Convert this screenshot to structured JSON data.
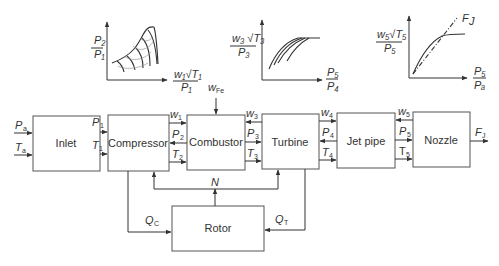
{
  "blocks": {
    "inlet": "Inlet",
    "compressor": "Compressor",
    "combustor": "Combustor",
    "turbine": "Turbine",
    "jetpipe": "Jet pipe",
    "nozzle": "Nozzle",
    "rotor": "Rotor"
  },
  "signals": {
    "Pa": {
      "main": "P",
      "sub": "a"
    },
    "Ta": {
      "main": "T",
      "sub": "a"
    },
    "P1": {
      "main": "P",
      "sub": "1"
    },
    "T1": {
      "main": "T",
      "sub": "1"
    },
    "w1": {
      "main": "w",
      "sub": "1"
    },
    "P2": {
      "main": "P",
      "sub": "2"
    },
    "T2": {
      "main": "T",
      "sub": "2"
    },
    "wFe": {
      "main": "w",
      "sub": "Fe"
    },
    "w3": {
      "main": "w",
      "sub": "3"
    },
    "P3": {
      "main": "P",
      "sub": "3"
    },
    "T3": {
      "main": "T",
      "sub": "3"
    },
    "w4": {
      "main": "w",
      "sub": "4"
    },
    "P4": {
      "main": "P",
      "sub": "4"
    },
    "T4": {
      "main": "T",
      "sub": "4"
    },
    "w5": {
      "main": "w",
      "sub": "5"
    },
    "P5": {
      "main": "P",
      "sub": "5"
    },
    "T5": {
      "main": "T",
      "sub": "5"
    },
    "FJ": {
      "main": "F",
      "sub": "J"
    },
    "N": {
      "main": "N"
    },
    "QC": {
      "main": "Q",
      "sub": "C"
    },
    "QT": {
      "main": "Q",
      "sub": "T"
    }
  },
  "maps": {
    "compressor": {
      "ylabel_num": "P₂",
      "ylabel_den": "P₁",
      "xlabel_num": "w₁√T₁",
      "xlabel_den": "P₁"
    },
    "turbine": {
      "ylabel_num": "w₃ √T₃",
      "ylabel_den": "P₃",
      "xlabel_num": "P₅",
      "xlabel_den": "P₄"
    },
    "nozzle": {
      "ylabel_num": "w₅√T₅",
      "ylabel_den": "P₅",
      "xlabel_num": "P₅",
      "xlabel_den": "Pₐ",
      "curve_label": "F",
      "curve_label_sub": "J"
    }
  }
}
